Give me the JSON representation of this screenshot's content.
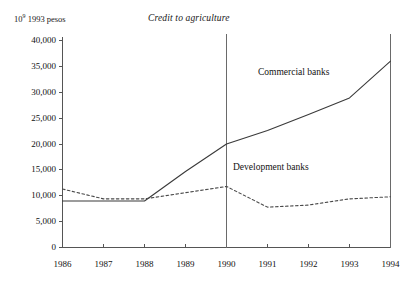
{
  "chart_data": {
    "type": "line",
    "title": "Credit to agriculture",
    "ylabel": "10⁹ 1993 pesos",
    "ylabel_mantissa": "10",
    "ylabel_exponent": "9",
    "ylabel_rest": " 1993 pesos",
    "xlabel": "",
    "x": [
      1986,
      1987,
      1988,
      1989,
      1990,
      1991,
      1992,
      1993,
      1994
    ],
    "categories": [
      "1986",
      "1987",
      "1988",
      "1989",
      "1990",
      "1991",
      "1992",
      "1993",
      "1994"
    ],
    "xlim": [
      1986,
      1994
    ],
    "ylim": [
      0,
      40000
    ],
    "yticks": [
      0,
      5000,
      10000,
      15000,
      20000,
      25000,
      30000,
      35000,
      40000
    ],
    "ytick_labels": [
      "0",
      "5,000",
      "10,000",
      "15,000",
      "20,000",
      "25,000",
      "30,000",
      "35,000",
      "40,000"
    ],
    "xticks": [
      1986,
      1987,
      1988,
      1989,
      1990,
      1991,
      1992,
      1993,
      1994
    ],
    "xtick_labels": [
      "1986",
      "1987",
      "1988",
      "1989",
      "1990",
      "1991",
      "1992",
      "1993",
      "1994"
    ],
    "grid": false,
    "legend_position": "inline-annotation",
    "series": [
      {
        "name": "Commercial banks",
        "style": "solid",
        "color": "#3a3a3a",
        "values": [
          9000,
          9000,
          9000,
          14700,
          20000,
          22600,
          25700,
          28900,
          36000
        ]
      },
      {
        "name": "Development banks",
        "style": "dashed",
        "color": "#4a4a4a",
        "values": [
          11300,
          9400,
          9400,
          10600,
          11800,
          7800,
          8200,
          9400,
          9800
        ]
      }
    ],
    "annotations": [
      {
        "text": "Commercial banks",
        "x": 1990.7,
        "y": 31500
      },
      {
        "text": "Development banks",
        "x": 1990.2,
        "y": 14700
      }
    ],
    "reference_lines": [
      {
        "orientation": "vertical",
        "x": 1990
      },
      {
        "orientation": "vertical",
        "x": 1994
      }
    ]
  }
}
